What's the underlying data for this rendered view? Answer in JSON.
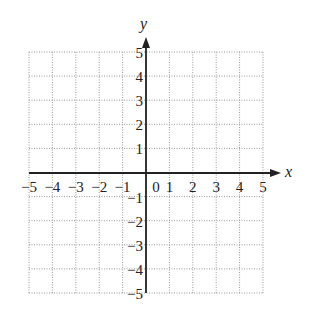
{
  "chart_data": {
    "type": "scatter",
    "title": "",
    "xlabel": "x",
    "ylabel": "y",
    "xlim": [
      -5,
      5
    ],
    "ylim": [
      -5,
      5
    ],
    "grid": true,
    "grid_style": "dotted",
    "x_ticks": [
      "-5",
      "-4",
      "-3",
      "-2",
      "-1",
      "0",
      "1",
      "2",
      "3",
      "4",
      "5"
    ],
    "y_ticks": [
      "5",
      "4",
      "3",
      "2",
      "1",
      "-1",
      "-2",
      "-3",
      "-4",
      "-5"
    ],
    "series": [],
    "legend": null
  },
  "colors": {
    "axis": "#222222",
    "grid": "#9a9a9a",
    "background": "#ffffff"
  }
}
